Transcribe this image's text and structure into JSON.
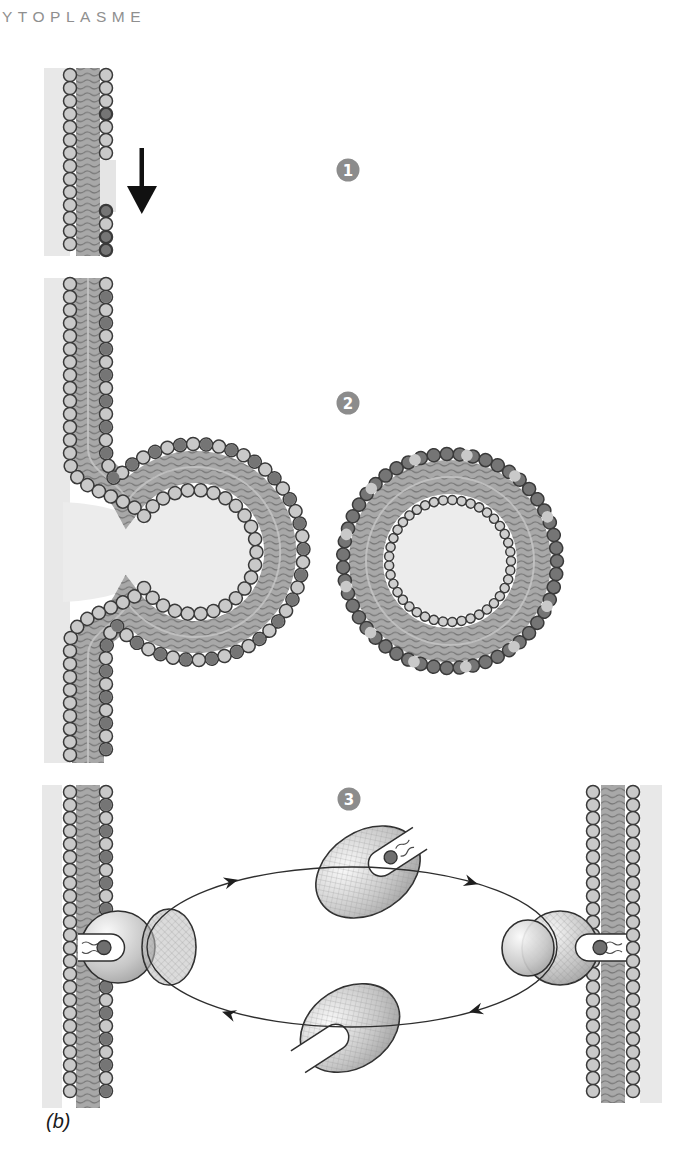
{
  "title": "YTOPLASME",
  "caption": "(b)",
  "steps": [
    {
      "number": "1",
      "marker": "step-badge"
    },
    {
      "number": "2",
      "marker": "step-badge"
    },
    {
      "number": "3",
      "marker": "step-badge"
    }
  ],
  "icons": [
    "down-arrow-icon",
    "step-1-badge",
    "step-2-badge",
    "step-3-badge",
    "cycle-arrowhead-icon"
  ],
  "diagram_parts": [
    "plasma-membrane-bilayer",
    "budding-membrane-vesicle",
    "free-lipid-vesicle",
    "lipid-transfer-protein-cycle"
  ],
  "colors": {
    "badge": "#8c8c8c",
    "membrane_tails": "#a8a8a8",
    "head_light": "#c9c9c9",
    "head_dark": "#757575",
    "cytoplasm_band": "#e8e8e8",
    "vesicle_interior": "#ececec",
    "outline": "#333333",
    "title_text": "#8f8f8f",
    "caption_text": "#1a1a1a"
  }
}
